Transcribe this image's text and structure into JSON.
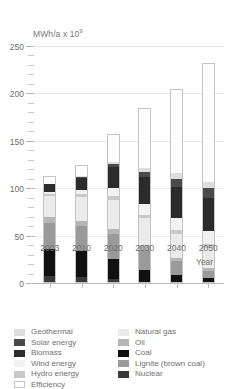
{
  "chart_data": {
    "type": "bar",
    "stacked": true,
    "title": "",
    "ylabel": "MWh/a x 10",
    "ylabel_exponent": "9",
    "xlabel": "Year",
    "categories": [
      "2003",
      "2010",
      "2020",
      "2030",
      "2040",
      "2050"
    ],
    "ylim": [
      0,
      250
    ],
    "ytick_labels": [
      "0",
      "50",
      "100",
      "150",
      "200",
      "250"
    ],
    "ytick_values": [
      0,
      50,
      100,
      150,
      200,
      250
    ],
    "minor_tick_step": 10,
    "grid": true,
    "grid_axis": "y",
    "legend_position": "below",
    "totals": [
      113,
      125,
      157,
      185,
      205,
      232
    ],
    "series": [
      {
        "name": "Nuclear",
        "color": "#3a3a3a",
        "values": [
          6,
          5,
          3,
          0,
          0,
          0
        ]
      },
      {
        "name": "Coal",
        "color": "#111111",
        "values": [
          30,
          28,
          22,
          13,
          8,
          4
        ]
      },
      {
        "name": "Lignite (brown coal)",
        "color": "#9a9a9a",
        "values": [
          28,
          27,
          26,
          21,
          14,
          8
        ]
      },
      {
        "name": "Oil",
        "color": "#b6b6b6",
        "values": [
          6,
          6,
          6,
          5,
          4,
          3
        ]
      },
      {
        "name": "Natural gas",
        "color": "#ebebeb",
        "values": [
          22,
          25,
          31,
          29,
          25,
          21
        ]
      },
      {
        "name": "Hydro energy",
        "color": "#c9c9c9",
        "values": [
          3,
          3,
          4,
          4,
          4,
          4
        ]
      },
      {
        "name": "Wind energy",
        "color": "#f2f2f2",
        "values": [
          2,
          5,
          9,
          11,
          13,
          14
        ]
      },
      {
        "name": "Biomass",
        "color": "#2b2b2b",
        "values": [
          8,
          13,
          22,
          29,
          33,
          35
        ]
      },
      {
        "name": "Solar energy",
        "color": "#4a4a4a",
        "values": [
          0,
          1,
          3,
          6,
          9,
          11
        ]
      },
      {
        "name": "Geothermal",
        "color": "#dedede",
        "values": [
          0,
          1,
          2,
          4,
          6,
          7
        ]
      },
      {
        "name": "Efficiency",
        "color": "#ffffff",
        "values": [
          8,
          11,
          29,
          63,
          89,
          125
        ]
      }
    ]
  },
  "legend": {
    "left_column": [
      {
        "label": "Geothermal",
        "color": "#dedede"
      },
      {
        "label": "Solar energy",
        "color": "#4a4a4a"
      },
      {
        "label": "Biomass",
        "color": "#2b2b2b"
      },
      {
        "label": "Wind energy",
        "color": "#f2f2f2"
      },
      {
        "label": "Hydro energy",
        "color": "#c9c9c9"
      },
      {
        "label": "Efficiency",
        "color": "#ffffff"
      }
    ],
    "right_column": [
      {
        "label": "Natural gas",
        "color": "#ebebeb"
      },
      {
        "label": "Oil",
        "color": "#b6b6b6"
      },
      {
        "label": "Coal",
        "color": "#111111"
      },
      {
        "label": "Lignite (brown coal)",
        "color": "#9a9a9a"
      },
      {
        "label": "Nuclear",
        "color": "#3a3a3a"
      }
    ]
  },
  "axes": {
    "y_axis_label_text": "MWh/a x 10",
    "y_axis_label_sup": "9",
    "x_axis_title": "Year"
  }
}
